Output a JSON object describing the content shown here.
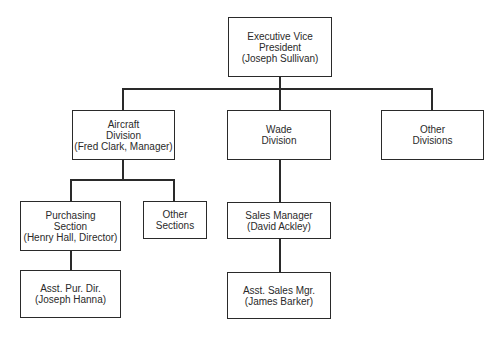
{
  "org_chart": {
    "root": {
      "lines": [
        "Executive Vice",
        "President",
        "(Joseph Sullivan)"
      ]
    },
    "divisions": [
      {
        "lines": [
          "Aircraft",
          "Division",
          "(Fred Clark, Manager)"
        ]
      },
      {
        "lines": [
          "Wade",
          "Division"
        ]
      },
      {
        "lines": [
          "Other",
          "Divisions"
        ]
      }
    ],
    "aircraft_sections": [
      {
        "lines": [
          "Purchasing",
          "Section",
          "(Henry Hall, Director)"
        ]
      },
      {
        "lines": [
          "Other",
          "Sections"
        ]
      }
    ],
    "purchasing_sub": {
      "lines": [
        "Asst. Pur. Dir.",
        "(Joseph Hanna)"
      ]
    },
    "wade_manager": {
      "lines": [
        "Sales Manager",
        "(David Ackley)"
      ]
    },
    "wade_sub": {
      "lines": [
        "Asst. Sales Mgr.",
        "(James Barker)"
      ]
    }
  }
}
